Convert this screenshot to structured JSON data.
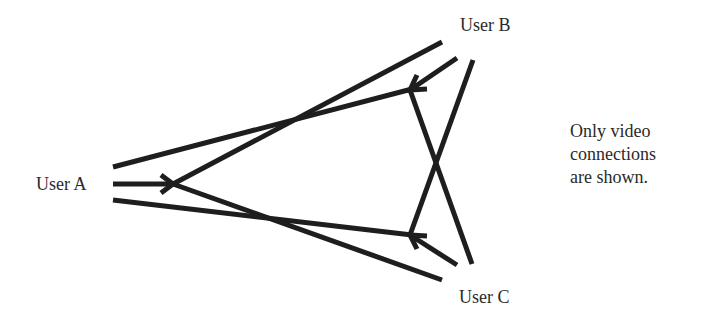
{
  "diagram": {
    "nodes": {
      "user_a": "User A",
      "user_b": "User B",
      "user_c": "User C"
    },
    "note": {
      "lines": [
        "Only video",
        "connections",
        "are shown."
      ]
    },
    "edges": [
      {
        "from": "User A",
        "to": "User B",
        "type": "video"
      },
      {
        "from": "User B",
        "to": "User A",
        "type": "video"
      },
      {
        "from": "User A",
        "to": "User C",
        "type": "video"
      },
      {
        "from": "User C",
        "to": "User A",
        "type": "video"
      },
      {
        "from": "User B",
        "to": "User C",
        "type": "video"
      },
      {
        "from": "User C",
        "to": "User B",
        "type": "video"
      }
    ],
    "colors": {
      "stroke": "#1e1e1e",
      "text": "#2a2a2a",
      "background": "#ffffff"
    }
  }
}
